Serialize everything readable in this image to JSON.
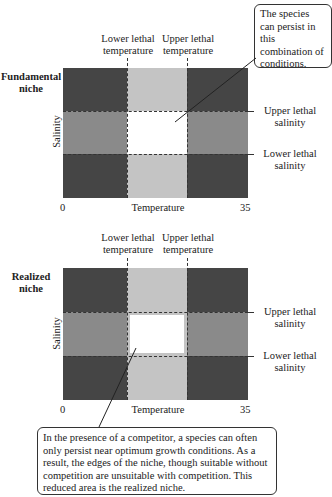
{
  "top_panel": {
    "title_line1": "Fundamental",
    "title_line2": "niche",
    "lower_temp_line1": "Lower lethal",
    "lower_temp_line2": "temperature",
    "upper_temp_line1": "Upper lethal",
    "upper_temp_line2": "temperature",
    "upper_sal_line1": "Upper lethal",
    "upper_sal_line2": "salinity",
    "lower_sal_line1": "Lower lethal",
    "lower_sal_line2": "salinity",
    "y_axis": "Salinity",
    "x_axis": "Temperature",
    "x_min": "0",
    "x_max": "35",
    "callout": "The species can persist in this combination of conditions."
  },
  "bottom_panel": {
    "title_line1": "Realized",
    "title_line2": "niche",
    "lower_temp_line1": "Lower lethal",
    "lower_temp_line2": "temperature",
    "upper_temp_line1": "Upper lethal",
    "upper_temp_line2": "temperature",
    "upper_sal_line1": "Upper lethal",
    "upper_sal_line2": "salinity",
    "lower_sal_line1": "Lower lethal",
    "lower_sal_line2": "salinity",
    "y_axis": "Salinity",
    "x_axis": "Temperature",
    "x_min": "0",
    "x_max": "35",
    "callout": "In the presence of a competitor, a species can often only persist near optimum growth conditions. As a result, the edges of the niche, though suitable without competition are unsuitable with competition. This reduced area is the realized niche."
  },
  "colors": {
    "dark": "#454545",
    "mid": "#8a8a8a",
    "light": "#c4c4c4",
    "niche": "#ffffff"
  }
}
